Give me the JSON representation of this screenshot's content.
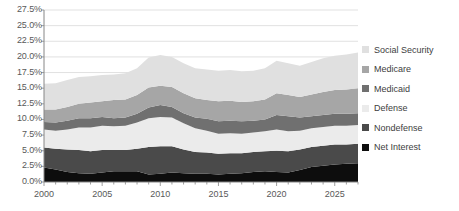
{
  "chart_data": {
    "type": "area",
    "stacked": true,
    "title": "",
    "xlabel": "",
    "ylabel": "",
    "xlim": [
      2000,
      2027
    ],
    "ylim": [
      0,
      27.5
    ],
    "ytick_labels": [
      "0.0%",
      "2.5%",
      "5.0%",
      "7.5%",
      "10.0%",
      "12.5%",
      "15.0%",
      "17.5%",
      "20.0%",
      "22.5%",
      "25.0%",
      "27.5%"
    ],
    "ytick_values": [
      0,
      2.5,
      5,
      7.5,
      10,
      12.5,
      15,
      17.5,
      20,
      22.5,
      25,
      27.5
    ],
    "xtick_labels": [
      "2000",
      "2005",
      "2010",
      "2015",
      "2020",
      "2025"
    ],
    "xtick_values": [
      2000,
      2005,
      2010,
      2015,
      2020,
      2025
    ],
    "grid": true,
    "legend_position": "right",
    "x": [
      2000,
      2001,
      2002,
      2003,
      2004,
      2005,
      2006,
      2007,
      2008,
      2009,
      2010,
      2011,
      2012,
      2013,
      2014,
      2015,
      2016,
      2017,
      2018,
      2019,
      2020,
      2021,
      2022,
      2023,
      2024,
      2025,
      2026,
      2027
    ],
    "series": [
      {
        "name": "Net Interest",
        "color": "#0d0d0d",
        "values": [
          2.3,
          2.0,
          1.6,
          1.4,
          1.3,
          1.5,
          1.7,
          1.7,
          1.7,
          1.2,
          1.3,
          1.5,
          1.4,
          1.3,
          1.3,
          1.2,
          1.3,
          1.4,
          1.6,
          1.7,
          1.6,
          1.5,
          1.9,
          2.4,
          2.6,
          2.8,
          2.9,
          3.0
        ]
      },
      {
        "name": "Nondefense",
        "color": "#4a4a4a",
        "values": [
          3.2,
          3.3,
          3.6,
          3.7,
          3.6,
          3.6,
          3.4,
          3.4,
          3.6,
          4.4,
          4.4,
          4.2,
          3.8,
          3.5,
          3.4,
          3.3,
          3.3,
          3.2,
          3.2,
          3.2,
          3.4,
          3.4,
          3.3,
          3.2,
          3.2,
          3.2,
          3.1,
          3.1
        ]
      },
      {
        "name": "Defense",
        "color": "#ebebeb",
        "values": [
          2.9,
          2.9,
          3.2,
          3.6,
          3.8,
          3.9,
          3.8,
          3.9,
          4.2,
          4.6,
          4.7,
          4.6,
          4.2,
          3.8,
          3.5,
          3.2,
          3.2,
          3.1,
          3.1,
          3.2,
          3.4,
          3.2,
          3.0,
          3.0,
          3.0,
          3.0,
          3.0,
          3.0
        ]
      },
      {
        "name": "Medicaid",
        "color": "#707070",
        "values": [
          1.2,
          1.3,
          1.4,
          1.5,
          1.5,
          1.4,
          1.3,
          1.3,
          1.4,
          1.7,
          1.9,
          1.7,
          1.6,
          1.7,
          1.9,
          2.0,
          2.0,
          2.0,
          1.9,
          1.9,
          2.3,
          2.4,
          2.1,
          1.9,
          1.9,
          1.9,
          1.9,
          1.9
        ]
      },
      {
        "name": "Medicare",
        "color": "#a6a6a6",
        "values": [
          2.0,
          2.1,
          2.2,
          2.3,
          2.5,
          2.5,
          2.9,
          2.9,
          3.0,
          3.2,
          3.1,
          3.2,
          3.2,
          3.1,
          3.0,
          3.2,
          3.2,
          3.1,
          3.1,
          3.2,
          3.5,
          3.4,
          3.3,
          3.5,
          3.7,
          3.8,
          3.9,
          4.0
        ]
      },
      {
        "name": "Social Security",
        "color": "#e0e0e0",
        "values": [
          4.1,
          4.2,
          4.3,
          4.3,
          4.2,
          4.2,
          4.1,
          4.2,
          4.3,
          4.8,
          4.9,
          4.8,
          4.8,
          4.8,
          4.9,
          4.9,
          4.9,
          4.9,
          4.9,
          5.0,
          5.2,
          5.1,
          5.0,
          5.2,
          5.4,
          5.5,
          5.6,
          5.7
        ]
      }
    ]
  },
  "axes": {
    "y_labels": [
      "27.5%",
      "25.0%",
      "22.5%",
      "20.0%",
      "17.5%",
      "15.0%",
      "12.5%",
      "10.0%",
      "7.5%",
      "5.0%",
      "2.5%",
      "0.0%"
    ],
    "x_labels": [
      "2000",
      "2005",
      "2010",
      "2015",
      "2020",
      "2025"
    ]
  },
  "legend": {
    "items": [
      {
        "label": "Social Security",
        "color": "#e0e0e0"
      },
      {
        "label": "Medicare",
        "color": "#a6a6a6"
      },
      {
        "label": "Medicaid",
        "color": "#707070"
      },
      {
        "label": "Defense",
        "color": "#ebebeb"
      },
      {
        "label": "Nondefense",
        "color": "#4a4a4a"
      },
      {
        "label": "Net Interest",
        "color": "#0d0d0d"
      }
    ]
  },
  "style": {
    "grid_color": "#d9d9d9",
    "axis_color": "#868686",
    "text_color": "#595959",
    "legend_text_color": "#404040",
    "background": "#ffffff"
  }
}
